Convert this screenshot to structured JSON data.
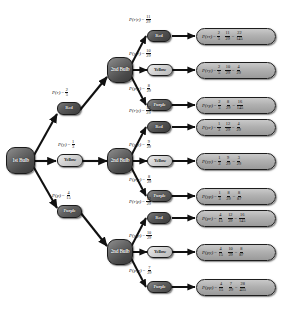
{
  "diagram": {
    "type": "probability-tree",
    "root": {
      "label": "1st Bulb"
    },
    "second_stage_label": "2nd Bulb",
    "colors": {
      "red_node_fill": "#4a4a4a",
      "yellow_node_fill": "#d2d2d2",
      "purple_node_fill": "#5e5e5e",
      "bulb_node_fill": "#5a5a5a",
      "result_box_fill": "#b0b0b0",
      "edge": "#111111",
      "background": "#ffffff"
    },
    "first_stage": [
      {
        "name": "Red",
        "label": "Red",
        "prob_text": "P(r)",
        "num": "2",
        "den": "5"
      },
      {
        "name": "Yellow",
        "label": "Yellow",
        "prob_text": "P(y)",
        "num": "1",
        "den": "3"
      },
      {
        "name": "Purple",
        "label": "Purple",
        "prob_text": "P(p)",
        "num": "4",
        "den": "15"
      }
    ],
    "branches": [
      {
        "first": "Red",
        "first_num": "2",
        "first_den": "5",
        "second_stage": [
          {
            "label": "Red",
            "cond_text": "P(r|r)",
            "cond_num": "11",
            "cond_den": "29",
            "result_text": "P(rr)",
            "res_num": "22",
            "res_den": "145"
          },
          {
            "label": "Yellow",
            "cond_text": "P(y|r)",
            "cond_num": "10",
            "cond_den": "29",
            "result_text": "P(ry)",
            "res_num": "4",
            "res_den": "29"
          },
          {
            "label": "Purple",
            "cond_text": "P(p|r)",
            "cond_num": "8",
            "cond_den": "29",
            "result_text": "P(rp)",
            "res_num": "16",
            "res_den": "145"
          }
        ]
      },
      {
        "first": "Yellow",
        "first_num": "1",
        "first_den": "3",
        "second_stage": [
          {
            "label": "Red",
            "cond_text": "P(r|y)",
            "cond_num": "12",
            "cond_den": "29",
            "result_text": "P(yr)",
            "res_num": "4",
            "res_den": "29"
          },
          {
            "label": "Yellow",
            "cond_text": "P(y|y)",
            "cond_num": "9",
            "cond_den": "29",
            "result_text": "P(yy)",
            "res_num": "3",
            "res_den": "29"
          },
          {
            "label": "Purple",
            "cond_text": "P(p|y)",
            "cond_num": "8",
            "cond_den": "29",
            "result_text": "P(yp)",
            "res_num": "8",
            "res_den": "87"
          }
        ]
      },
      {
        "first": "Purple",
        "first_num": "4",
        "first_den": "15",
        "second_stage": [
          {
            "label": "Red",
            "cond_text": "P(r|p)",
            "cond_num": "12",
            "cond_den": "29",
            "result_text": "P(pr)",
            "res_num": "16",
            "res_den": "145"
          },
          {
            "label": "Yellow",
            "cond_text": "P(y|p)",
            "cond_num": "10",
            "cond_den": "29",
            "result_text": "P(py)",
            "res_num": "8",
            "res_den": "87"
          },
          {
            "label": "Purple",
            "cond_text": "P(p|p)",
            "cond_num": "7",
            "cond_den": "29",
            "result_text": "P(pp)",
            "res_num": "28",
            "res_den": "435"
          }
        ]
      }
    ]
  }
}
